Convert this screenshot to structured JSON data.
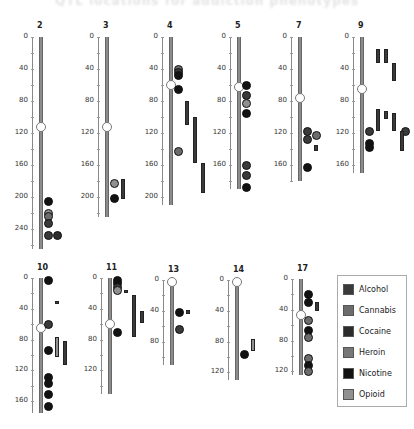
{
  "title": "QTL locations for addiction phenotypes",
  "legend": {
    "items": [
      {
        "label": "Alcohol",
        "color": "#3a3a3a"
      },
      {
        "label": "Cannabis",
        "color": "#6c6c6c"
      },
      {
        "label": "Cocaine",
        "color": "#2c2c2c"
      },
      {
        "label": "Heroin",
        "color": "#777777"
      },
      {
        "label": "Nicotine",
        "color": "#121212"
      },
      {
        "label": "Opioid",
        "color": "#909090"
      }
    ]
  },
  "chart_data": {
    "type": "ideogram",
    "units": "cM",
    "chromosomes": [
      {
        "name": "2",
        "length": 265,
        "centromere": 113,
        "ticks": [
          0,
          40,
          80,
          120,
          160,
          200,
          240
        ],
        "dots": [
          {
            "pos": 205,
            "type": "Nicotine",
            "col": 0
          },
          {
            "pos": 220,
            "type": "Opioid",
            "col": 0
          },
          {
            "pos": 224,
            "type": "Cannabis",
            "col": 0
          },
          {
            "pos": 233,
            "type": "Alcohol",
            "col": 0
          },
          {
            "pos": 247,
            "type": "Alcohol",
            "col": 0
          },
          {
            "pos": 247,
            "type": "Cocaine",
            "col": 1
          }
        ],
        "bars": []
      },
      {
        "name": "3",
        "length": 225,
        "centromere": 113,
        "ticks": [
          0,
          40,
          80,
          120,
          160,
          200
        ],
        "dots": [
          {
            "pos": 182,
            "type": "Opioid",
            "col": 0
          },
          {
            "pos": 201,
            "type": "Nicotine",
            "col": 0
          }
        ],
        "bars": [
          {
            "start": 178,
            "end": 202,
            "type": "Alcohol",
            "col": 1
          }
        ]
      },
      {
        "name": "4",
        "length": 210,
        "centromere": 60,
        "ticks": [
          0,
          40,
          80,
          120,
          160,
          200
        ],
        "dots": [
          {
            "pos": 40,
            "type": "Cannabis",
            "col": 0
          },
          {
            "pos": 44,
            "type": "Alcohol",
            "col": 0
          },
          {
            "pos": 48,
            "type": "Nicotine",
            "col": 0
          },
          {
            "pos": 65,
            "type": "Nicotine",
            "col": 0
          },
          {
            "pos": 143,
            "type": "Cannabis",
            "col": 0
          }
        ],
        "bars": [
          {
            "start": 80,
            "end": 110,
            "type": "Alcohol",
            "col": 1
          },
          {
            "start": 100,
            "end": 158,
            "type": "Alcohol",
            "col": 2
          },
          {
            "start": 157,
            "end": 195,
            "type": "Alcohol",
            "col": 3
          }
        ]
      },
      {
        "name": "5",
        "length": 190,
        "centromere": 62,
        "ticks": [
          0,
          40,
          80,
          120,
          160
        ],
        "dots": [
          {
            "pos": 60,
            "type": "Nicotine",
            "col": 0
          },
          {
            "pos": 73,
            "type": "Alcohol",
            "col": 0
          },
          {
            "pos": 82,
            "type": "Opioid",
            "col": 0
          },
          {
            "pos": 95,
            "type": "Nicotine",
            "col": 0
          },
          {
            "pos": 160,
            "type": "Alcohol",
            "col": 0
          },
          {
            "pos": 173,
            "type": "Alcohol",
            "col": 0
          },
          {
            "pos": 187,
            "type": "Nicotine",
            "col": 0
          }
        ],
        "bars": []
      },
      {
        "name": "7",
        "length": 180,
        "centromere": 76,
        "ticks": [
          0,
          40,
          80,
          120,
          160
        ],
        "dots": [
          {
            "pos": 117,
            "type": "Alcohol",
            "col": 0
          },
          {
            "pos": 128,
            "type": "Alcohol",
            "col": 0
          },
          {
            "pos": 122,
            "type": "Cannabis",
            "col": 1
          },
          {
            "pos": 162,
            "type": "Nicotine",
            "col": 0
          }
        ],
        "bars": [
          {
            "start": 135,
            "end": 142,
            "type": "Alcohol",
            "col": 1
          }
        ]
      },
      {
        "name": "9",
        "length": 170,
        "centromere": 65,
        "ticks": [
          0,
          40,
          80,
          120,
          160
        ],
        "dots": [
          {
            "pos": 117,
            "type": "Alcohol",
            "col": 0
          },
          {
            "pos": 133,
            "type": "Nicotine",
            "col": 0
          },
          {
            "pos": 137,
            "type": "Nicotine",
            "col": 0
          },
          {
            "pos": 117,
            "type": "Alcohol",
            "col": 4
          }
        ],
        "bars": [
          {
            "start": 15,
            "end": 32,
            "type": "Alcohol",
            "col": 1
          },
          {
            "start": 15,
            "end": 32,
            "type": "Alcohol",
            "col": 2
          },
          {
            "start": 32,
            "end": 55,
            "type": "Alcohol",
            "col": 3
          },
          {
            "start": 90,
            "end": 118,
            "type": "Alcohol",
            "col": 1
          },
          {
            "start": 93,
            "end": 103,
            "type": "Alcohol",
            "col": 2
          },
          {
            "start": 95,
            "end": 118,
            "type": "Alcohol",
            "col": 3
          },
          {
            "start": 118,
            "end": 143,
            "type": "Alcohol",
            "col": 4
          }
        ]
      },
      {
        "name": "10",
        "length": 175,
        "centromere": 65,
        "ticks": [
          0,
          40,
          80,
          120,
          160
        ],
        "dots": [
          {
            "pos": 2,
            "type": "Nicotine",
            "col": 0
          },
          {
            "pos": 60,
            "type": "Alcohol",
            "col": 0
          },
          {
            "pos": 94,
            "type": "Nicotine",
            "col": 0
          },
          {
            "pos": 128,
            "type": "Nicotine",
            "col": 0
          },
          {
            "pos": 137,
            "type": "Nicotine",
            "col": 0
          },
          {
            "pos": 150,
            "type": "Nicotine",
            "col": 0
          },
          {
            "pos": 166,
            "type": "Nicotine",
            "col": 0
          }
        ],
        "bars": [
          {
            "start": 30,
            "end": 34,
            "type": "Alcohol",
            "col": 1
          },
          {
            "start": 77,
            "end": 102,
            "type": "Opioid",
            "col": 1
          },
          {
            "start": 82,
            "end": 113,
            "type": "Alcohol",
            "col": 2
          }
        ]
      },
      {
        "name": "11",
        "length": 150,
        "centromere": 60,
        "ticks": [
          0,
          40,
          80,
          120
        ],
        "dots": [
          {
            "pos": 2,
            "type": "Nicotine",
            "col": 0
          },
          {
            "pos": 7,
            "type": "Nicotine",
            "col": 0
          },
          {
            "pos": 12,
            "type": "Alcohol",
            "col": 0
          },
          {
            "pos": 16,
            "type": "Opioid",
            "col": 0
          },
          {
            "pos": 70,
            "type": "Nicotine",
            "col": 0
          }
        ],
        "bars": [
          {
            "start": 16,
            "end": 20,
            "type": "Alcohol",
            "col": 1
          },
          {
            "start": 22,
            "end": 77,
            "type": "Alcohol",
            "col": 2
          },
          {
            "start": 43,
            "end": 59,
            "type": "Alcohol",
            "col": 3
          }
        ]
      },
      {
        "name": "13",
        "length": 110,
        "centromere": 2,
        "ticks": [
          0,
          40,
          80
        ],
        "dots": [
          {
            "pos": 42,
            "type": "Nicotine",
            "col": 0
          },
          {
            "pos": 64,
            "type": "Alcohol",
            "col": 0
          }
        ],
        "bars": [
          {
            "start": 39,
            "end": 44,
            "type": "Alcohol",
            "col": 1
          }
        ]
      },
      {
        "name": "14",
        "length": 130,
        "centromere": 2,
        "ticks": [
          0,
          40,
          80,
          120
        ],
        "dots": [
          {
            "pos": 96,
            "type": "Nicotine",
            "col": 0
          }
        ],
        "bars": [
          {
            "start": 77,
            "end": 92,
            "type": "Opioid",
            "col": 1
          }
        ]
      },
      {
        "name": "17",
        "length": 125,
        "centromere": 47,
        "ticks": [
          0,
          40,
          80,
          120
        ],
        "dots": [
          {
            "pos": 20,
            "type": "Nicotine",
            "col": 0
          },
          {
            "pos": 30,
            "type": "Nicotine",
            "col": 0
          },
          {
            "pos": 53,
            "type": "Cannabis",
            "col": 0
          },
          {
            "pos": 66,
            "type": "Nicotine",
            "col": 0
          },
          {
            "pos": 75,
            "type": "Cannabis",
            "col": 0
          },
          {
            "pos": 103,
            "type": "Cannabis",
            "col": 0
          },
          {
            "pos": 112,
            "type": "Nicotine",
            "col": 0
          },
          {
            "pos": 119,
            "type": "Cannabis",
            "col": 0
          }
        ],
        "bars": [
          {
            "start": 30,
            "end": 42,
            "type": "Alcohol",
            "col": 1
          }
        ]
      }
    ]
  }
}
